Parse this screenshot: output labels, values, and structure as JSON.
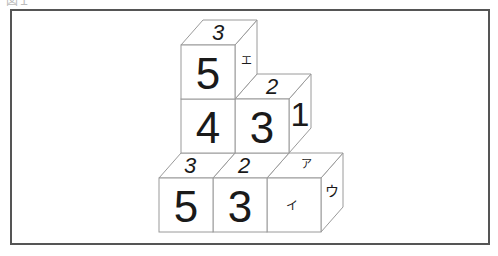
{
  "figure": {
    "caption": "図１",
    "cubes": {
      "top_cube": {
        "front": "5",
        "top": "3",
        "right": "エ"
      },
      "middle_left": {
        "front": "4"
      },
      "middle_right": {
        "front": "3",
        "top": "2",
        "right": "1"
      },
      "bottom_left": {
        "front": "5",
        "top": "3"
      },
      "bottom_middle": {
        "front": "3",
        "top": "2"
      },
      "bottom_right": {
        "front": "イ",
        "top": "ア",
        "right": "ウ"
      }
    }
  }
}
